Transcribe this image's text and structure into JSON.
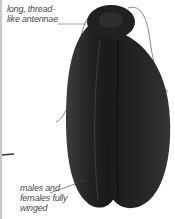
{
  "figure": {
    "colors": {
      "body": "#1e1e1e",
      "wing_highlight": "#3a3a3a",
      "antenna": "#777777",
      "leader_line": "#555555",
      "label_text": "#4a4a4a"
    }
  },
  "labels": {
    "antennae": {
      "line1": "long, thread-",
      "line2": "like antennae"
    },
    "wings": {
      "line1": "males and",
      "line2": "females fully",
      "line3": "winged"
    }
  }
}
